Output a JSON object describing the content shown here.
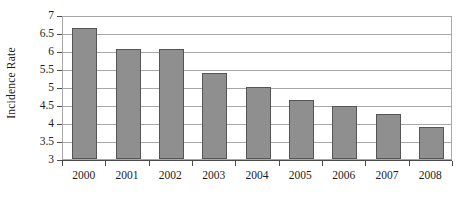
{
  "chart_data": {
    "type": "bar",
    "title": "",
    "xlabel": "",
    "ylabel": "Incidence Rate",
    "categories": [
      "2000",
      "2001",
      "2002",
      "2003",
      "2004",
      "2005",
      "2006",
      "2007",
      "2008"
    ],
    "values": [
      6.65,
      6.05,
      6.05,
      5.4,
      5.0,
      4.63,
      4.48,
      4.25,
      3.88
    ],
    "ylim": [
      3,
      7
    ],
    "ytick_step": 0.5,
    "ytick_labels": [
      "7",
      "6.5",
      "6",
      "5.5",
      "5",
      "4.5",
      "4",
      "3.5",
      "3"
    ],
    "ytick_values": [
      7,
      6.5,
      6,
      5.5,
      5,
      4.5,
      4,
      3.5,
      3
    ],
    "grid": true,
    "legend": false,
    "legend_position": "none",
    "series": [
      {
        "name": "Incidence Rate",
        "values": [
          6.65,
          6.05,
          6.05,
          5.4,
          5.0,
          4.63,
          4.48,
          4.25,
          3.88
        ]
      }
    ],
    "colors": {
      "bar_fill": "#8f8f8f",
      "bar_border": "#555555",
      "gridline": "#a8a8a8",
      "axis": "#4a4a4a",
      "text": "#1d1d1d",
      "background": "#ffffff"
    }
  }
}
